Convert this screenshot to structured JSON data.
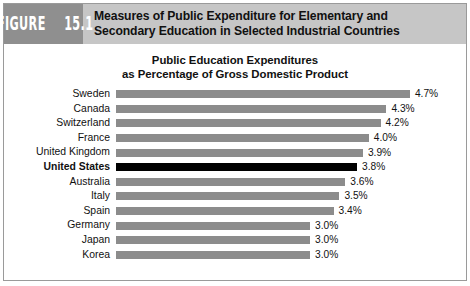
{
  "figure": {
    "badge_word": "FIGURE",
    "badge_number": "15.1",
    "title_line1": "Measures of Public Expenditure for Elementary and",
    "title_line2": "Secondary Education in Selected Industrial Countries"
  },
  "colors": {
    "header_band": "#c6c6c6",
    "badge": "#8f8f8f",
    "bar": "#8c8c8c",
    "bar_highlight": "#000000",
    "frame_border": "#9a9a9a",
    "text": "#111111"
  },
  "chart_data": {
    "type": "bar",
    "orientation": "horizontal",
    "title": "Public Education Expenditures\nas Percentage of Gross Domestic Product",
    "title_line1": "Public Education Expenditures",
    "title_line2": "as Percentage of Gross Domestic Product",
    "xlabel": "",
    "ylabel": "",
    "xlim": [
      0,
      4.7
    ],
    "grid": false,
    "legend": false,
    "axis_visible": false,
    "value_suffix": "%",
    "highlight_category": "United States",
    "categories": [
      "Sweden",
      "Canada",
      "Switzerland",
      "France",
      "United Kingdom",
      "United States",
      "Australia",
      "Italy",
      "Spain",
      "Germany",
      "Japan",
      "Korea"
    ],
    "values": [
      4.7,
      4.3,
      4.2,
      4.0,
      3.9,
      3.8,
      3.6,
      3.5,
      3.4,
      3.0,
      3.0,
      3.0
    ],
    "labels": [
      "4.7%",
      "4.3%",
      "4.2%",
      "4.0%",
      "3.9%",
      "3.8%",
      "3.6%",
      "3.5%",
      "3.4%",
      "3.0%",
      "3.0%",
      "3.0%"
    ],
    "rows": [
      {
        "category": "Sweden",
        "value": 4.7,
        "label": "4.7%",
        "highlight": false
      },
      {
        "category": "Canada",
        "value": 4.3,
        "label": "4.3%",
        "highlight": false
      },
      {
        "category": "Switzerland",
        "value": 4.2,
        "label": "4.2%",
        "highlight": false
      },
      {
        "category": "France",
        "value": 4.0,
        "label": "4.0%",
        "highlight": false
      },
      {
        "category": "United Kingdom",
        "value": 3.9,
        "label": "3.9%",
        "highlight": false
      },
      {
        "category": "United States",
        "value": 3.8,
        "label": "3.8%",
        "highlight": true
      },
      {
        "category": "Australia",
        "value": 3.6,
        "label": "3.6%",
        "highlight": false
      },
      {
        "category": "Italy",
        "value": 3.5,
        "label": "3.5%",
        "highlight": false
      },
      {
        "category": "Spain",
        "value": 3.4,
        "label": "3.4%",
        "highlight": false
      },
      {
        "category": "Germany",
        "value": 3.0,
        "label": "3.0%",
        "highlight": false
      },
      {
        "category": "Japan",
        "value": 3.0,
        "label": "3.0%",
        "highlight": false
      },
      {
        "category": "Korea",
        "value": 3.0,
        "label": "3.0%",
        "highlight": false
      }
    ]
  },
  "scale": {
    "bar_origin_px": 118,
    "px_per_unit": 58.8,
    "baseline_value": 3.0,
    "baseline_px": 194
  }
}
